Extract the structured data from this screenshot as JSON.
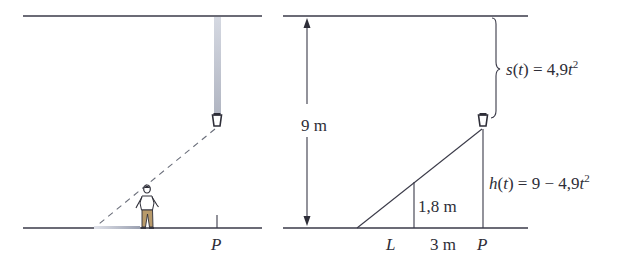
{
  "left_panel": {
    "point_label": "P"
  },
  "right_panel": {
    "height_label": "9 m",
    "person_height_label": "1,8 m",
    "distance_label": "3 m",
    "shadow_point_label": "L",
    "point_label": "P",
    "fall_distance": {
      "func": "s",
      "var": "t",
      "rhs": "= 4,9",
      "exp_var": "t",
      "exponent": "2"
    },
    "height_func": {
      "func": "h",
      "var": "t",
      "rhs": "= 9 − 4,9",
      "exp_var": "t",
      "exponent": "2"
    }
  },
  "colors": {
    "line": "#3a3a48",
    "streak": "#b8bcc8",
    "shirt": "#ffffff",
    "pants": "#b89a6a",
    "text": "#2e2e38"
  }
}
